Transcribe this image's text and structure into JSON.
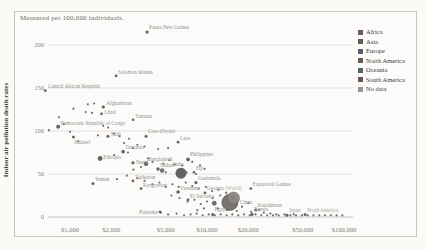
{
  "chart_data": {
    "type": "scatter",
    "subtitle": "Measured per 100,000 individuals.",
    "ylabel": "Indoor air pollution death rates",
    "x_scale": "log",
    "x_ticks": [
      {
        "label": "$1,000",
        "value": 1000
      },
      {
        "label": "$2,000",
        "value": 2000
      },
      {
        "label": "$5,000",
        "value": 5000
      },
      {
        "label": "$10,000",
        "value": 10000
      },
      {
        "label": "$20,000",
        "value": 20000
      },
      {
        "label": "$50,000",
        "value": 50000
      },
      {
        "label": "$100,000",
        "value": 100000
      }
    ],
    "y_ticks": [
      0,
      50,
      100,
      150,
      200
    ],
    "x_range": [
      600,
      110000
    ],
    "y_range": [
      0,
      230
    ],
    "grid": true,
    "legend": {
      "position": "top-right",
      "items": [
        {
          "label": "Africa",
          "color": "#655a66"
        },
        {
          "label": "Asia",
          "color": "#5d5d58"
        },
        {
          "label": "Europe",
          "color": "#585f68"
        },
        {
          "label": "North America",
          "color": "#6b5a55"
        },
        {
          "label": "Oceania",
          "color": "#53626a"
        },
        {
          "label": "South America",
          "color": "#675157"
        },
        {
          "label": "No data",
          "color": "#969696"
        }
      ]
    },
    "points": [
      {
        "name": "Papua New Guinea",
        "gdp": 3650,
        "rate": 215,
        "r": 1.6,
        "label": {
          "dx": 2,
          "dy": -3
        }
      },
      {
        "name": "Solomon Islands",
        "gdp": 2170,
        "rate": 164,
        "r": 1.4,
        "label": {
          "dx": 2,
          "dy": -2
        }
      },
      {
        "name": "Central African Republic",
        "gdp": 660,
        "rate": 147,
        "r": 1.4,
        "label": {
          "dx": 3,
          "dy": -3
        }
      },
      {
        "name": "Afghanistan",
        "gdp": 1750,
        "rate": 128,
        "r": 1.6,
        "label": {
          "dx": 3,
          "dy": -2
        }
      },
      {
        "name": "Chad",
        "gdp": 1700,
        "rate": 120,
        "r": 1.4,
        "label": {
          "dx": 3,
          "dy": 0
        }
      },
      {
        "name": "Vanuatu",
        "gdp": 2890,
        "rate": 113,
        "r": 1.3,
        "label": {
          "dx": 2,
          "dy": -2
        }
      },
      {
        "name": "Democratic Republic of Congo",
        "gdp": 820,
        "rate": 105,
        "r": 2.0,
        "label": {
          "dx": 2,
          "dy": -2
        }
      },
      {
        "name": "Malawi",
        "gdp": 1060,
        "rate": 93,
        "r": 1.5,
        "label": {
          "dx": 1,
          "dy": 7
        }
      },
      {
        "name": "Mali",
        "gdp": 1890,
        "rate": 94,
        "r": 1.5,
        "label": {
          "dx": 3,
          "dy": 0
        }
      },
      {
        "name": "Cote d'Ivoire",
        "gdp": 3590,
        "rate": 94,
        "r": 1.5,
        "label": {
          "dx": 2,
          "dy": -3
        }
      },
      {
        "name": "Laos",
        "gdp": 6150,
        "rate": 87,
        "r": 1.4,
        "label": {
          "dx": 2,
          "dy": -2
        }
      },
      {
        "name": "Tanzania",
        "gdp": 2440,
        "rate": 76,
        "r": 1.8,
        "label": {
          "dx": 2,
          "dy": -3
        }
      },
      {
        "name": "Ethiopia",
        "gdp": 1660,
        "rate": 68,
        "r": 2.4,
        "label": {
          "dx": 3,
          "dy": 0
        }
      },
      {
        "name": "Philippines",
        "gdp": 7270,
        "rate": 67,
        "r": 1.9,
        "label": {
          "dx": 2,
          "dy": -3
        }
      },
      {
        "name": "Nepal",
        "gdp": 2880,
        "rate": 63,
        "r": 1.6,
        "label": {
          "dx": 3,
          "dy": 1
        }
      },
      {
        "name": "Bangladesh",
        "gdp": 3590,
        "rate": 62,
        "r": 2.2,
        "label": {
          "dx": 2,
          "dy": -3
        }
      },
      {
        "name": "Sudan",
        "gdp": 4390,
        "rate": 56,
        "r": 1.7,
        "label": {
          "dx": 2,
          "dy": -2
        }
      },
      {
        "name": "India",
        "gdp": 6460,
        "rate": 51,
        "r": 5.5,
        "label": {
          "dx": -3,
          "dy": -7,
          "anchor": "middle"
        }
      },
      {
        "name": "Fiji",
        "gdp": 8030,
        "rate": 52,
        "r": 1.3,
        "label": {
          "dx": 2,
          "dy": -2
        }
      },
      {
        "name": "Yemen",
        "gdp": 1470,
        "rate": 39,
        "r": 1.5,
        "label": {
          "dx": 2,
          "dy": -2
        }
      },
      {
        "name": "Tajikistan",
        "gdp": 2880,
        "rate": 42,
        "r": 1.4,
        "label": {
          "dx": 2,
          "dy": -2
        }
      },
      {
        "name": "Kyrgyzstan",
        "gdp": 3300,
        "rate": 33,
        "r": 1.4,
        "label": {
          "dx": 2,
          "dy": -2
        }
      },
      {
        "name": "Guatemala",
        "gdp": 8300,
        "rate": 40,
        "r": 1.6,
        "label": {
          "dx": 2,
          "dy": -3
        }
      },
      {
        "name": "Georgia",
        "gdp": 9670,
        "rate": 28,
        "r": 1.4,
        "label": {
          "dx": 2,
          "dy": -3
        }
      },
      {
        "name": "Vietnam",
        "gdp": 6150,
        "rate": 29,
        "r": 1.8,
        "label": {
          "dx": 2,
          "dy": -2
        }
      },
      {
        "name": "El Salvador",
        "gdp": 7270,
        "rate": 20,
        "r": 1.4,
        "label": {
          "dx": 2,
          "dy": -2
        }
      },
      {
        "name": "(World)",
        "gdp": 15600,
        "rate": 22,
        "r": 6.0,
        "label": {
          "dx": 0,
          "dy": -8,
          "anchor": "middle",
          "light": true
        },
        "fill": "#8a8782",
        "stroke": "#6f6c67"
      },
      {
        "name": "China",
        "gdp": 14700,
        "rate": 17,
        "r": 8.0,
        "label": {
          "dx": 10,
          "dy": 2
        },
        "fill": "#6e6863",
        "stroke": "#4f4a46"
      },
      {
        "name": "Equatorial Guinea",
        "gdp": 20900,
        "rate": 33,
        "r": 1.4,
        "label": {
          "dx": 2,
          "dy": -3
        }
      },
      {
        "name": "Kazakhstan",
        "gdp": 22700,
        "rate": 8,
        "r": 1.5,
        "label": {
          "dx": 2,
          "dy": -3
        }
      },
      {
        "name": "Palestine",
        "gdp": 4540,
        "rate": 6,
        "r": 1.4,
        "label": {
          "dx": -2,
          "dy": 2,
          "anchor": "end"
        }
      },
      {
        "name": "Egypt",
        "gdp": 11000,
        "rate": 3,
        "r": 1.5,
        "label": {
          "dx": 2,
          "dy": -3
        }
      },
      {
        "name": "Russia",
        "gdp": 21300,
        "rate": 3,
        "r": 1.6,
        "label": {
          "dx": 2,
          "dy": -3
        }
      },
      {
        "name": "Japan",
        "gdp": 38300,
        "rate": 2,
        "r": 1.5,
        "label": {
          "dx": 2,
          "dy": -3,
          "light": true
        }
      },
      {
        "name": "North America",
        "gdp": 52000,
        "rate": 3,
        "r": 1.5,
        "label": {
          "dx": 2,
          "dy": -2,
          "light": true
        }
      }
    ],
    "background_points": [
      [
        700,
        101
      ],
      [
        1000,
        99
      ],
      [
        830,
        116
      ],
      [
        900,
        108
      ],
      [
        1350,
        131
      ],
      [
        1500,
        132
      ],
      [
        1300,
        122
      ],
      [
        1450,
        121
      ],
      [
        1060,
        126
      ],
      [
        1750,
        106
      ],
      [
        1900,
        104
      ],
      [
        2100,
        97
      ],
      [
        1150,
        88
      ],
      [
        1600,
        95
      ],
      [
        2300,
        94
      ],
      [
        2700,
        91
      ],
      [
        2480,
        86
      ],
      [
        3100,
        84
      ],
      [
        2880,
        80
      ],
      [
        3500,
        82
      ],
      [
        2650,
        75
      ],
      [
        2100,
        72
      ],
      [
        4400,
        79
      ],
      [
        5200,
        80
      ],
      [
        3700,
        68
      ],
      [
        4000,
        64
      ],
      [
        4800,
        62
      ],
      [
        5300,
        66
      ],
      [
        5800,
        61
      ],
      [
        6600,
        60
      ],
      [
        4400,
        55
      ],
      [
        5000,
        52
      ],
      [
        3300,
        58
      ],
      [
        2900,
        55
      ],
      [
        7800,
        64
      ],
      [
        8900,
        60
      ],
      [
        9600,
        56
      ],
      [
        7100,
        52
      ],
      [
        8300,
        50
      ],
      [
        4700,
        54,
        2.2
      ],
      [
        3100,
        45
      ],
      [
        3500,
        42
      ],
      [
        4000,
        38
      ],
      [
        4500,
        40
      ],
      [
        5000,
        35
      ],
      [
        5600,
        38
      ],
      [
        6200,
        35
      ],
      [
        7000,
        40
      ],
      [
        7800,
        36
      ],
      [
        8700,
        33
      ],
      [
        9800,
        35
      ],
      [
        2600,
        48
      ],
      [
        2200,
        44
      ],
      [
        10900,
        30
      ],
      [
        12100,
        32
      ],
      [
        5500,
        25
      ],
      [
        6300,
        22
      ],
      [
        7200,
        18
      ],
      [
        8100,
        20
      ],
      [
        9000,
        15
      ],
      [
        10000,
        18
      ],
      [
        11000,
        22
      ],
      [
        12500,
        25
      ],
      [
        13800,
        28
      ],
      [
        16000,
        15
      ],
      [
        18000,
        12
      ],
      [
        20000,
        16
      ],
      [
        9500,
        10
      ],
      [
        8500,
        8
      ],
      [
        12000,
        10
      ],
      [
        14000,
        8
      ],
      [
        16500,
        7
      ],
      [
        11300,
        16,
        2.4
      ],
      [
        4600,
        5
      ],
      [
        5200,
        3
      ],
      [
        6000,
        4
      ],
      [
        6800,
        2
      ],
      [
        7600,
        3
      ],
      [
        8400,
        4
      ],
      [
        9300,
        2
      ],
      [
        10300,
        3
      ],
      [
        11400,
        2
      ],
      [
        12600,
        3
      ],
      [
        13900,
        2
      ],
      [
        15300,
        3
      ],
      [
        16900,
        2
      ],
      [
        18600,
        3
      ],
      [
        20500,
        2
      ],
      [
        22600,
        3
      ],
      [
        24900,
        2
      ],
      [
        27500,
        2
      ],
      [
        30300,
        2
      ],
      [
        33400,
        2
      ],
      [
        36800,
        3
      ],
      [
        40600,
        2
      ],
      [
        44700,
        2
      ],
      [
        49300,
        2
      ],
      [
        54300,
        2
      ],
      [
        59900,
        2
      ],
      [
        66000,
        2
      ],
      [
        72700,
        2
      ],
      [
        80100,
        2
      ],
      [
        88300,
        2
      ],
      [
        97300,
        2
      ],
      [
        26000,
        5
      ],
      [
        29000,
        4
      ],
      [
        24000,
        8
      ],
      [
        21000,
        6
      ],
      [
        32000,
        3
      ],
      [
        43000,
        3
      ]
    ]
  }
}
